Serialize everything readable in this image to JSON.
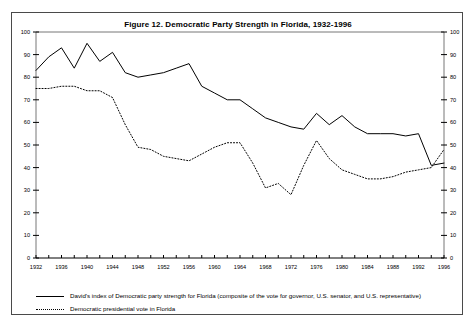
{
  "figure": {
    "title": "Figure 12.  Democratic Party Strength in Florida, 1932-1996",
    "border_color": "#4a4a4a",
    "background": "#ffffff"
  },
  "legend": {
    "position": "below-plot",
    "entries": [
      {
        "marker": "solid-line",
        "label": "David's index of Democratic party strength for Florida (composite of the vote for governor, U.S. senator, and U.S. representative)"
      },
      {
        "marker": "dotted-line",
        "label": "Democratic presidential vote in Florida"
      }
    ]
  },
  "chart_data": {
    "type": "line",
    "title": "Figure 12.  Democratic Party Strength in Florida, 1932-1996",
    "xlabel": "",
    "ylabel": "",
    "xlim": [
      1932,
      1996
    ],
    "ylim": [
      0,
      100
    ],
    "ytick_step": 10,
    "xtick_step": 2,
    "xlabel_step": 4,
    "grid": false,
    "dual_y_axis": true,
    "left_axis_labels": [
      "0",
      "10",
      "20",
      "30",
      "40",
      "50",
      "60",
      "70",
      "80",
      "90",
      "100"
    ],
    "right_axis_labels": [
      "0",
      "10",
      "20",
      "30",
      "40",
      "50",
      "60",
      "70",
      "80",
      "90",
      "100"
    ],
    "xtick_labels": [
      "1932",
      "1936",
      "1940",
      "1944",
      "1948",
      "1952",
      "1956",
      "1960",
      "1964",
      "1968",
      "1972",
      "1976",
      "1980",
      "1984",
      "1988",
      "1992",
      "1996"
    ],
    "x": [
      1932,
      1934,
      1936,
      1938,
      1940,
      1942,
      1944,
      1946,
      1948,
      1950,
      1952,
      1954,
      1956,
      1958,
      1960,
      1962,
      1964,
      1966,
      1968,
      1970,
      1972,
      1974,
      1976,
      1978,
      1980,
      1982,
      1984,
      1986,
      1988,
      1990,
      1992,
      1994,
      1996
    ],
    "series": [
      {
        "name": "David's index of Democratic party strength for Florida (composite of the vote for governor, U.S. senator, and U.S. representative)",
        "style": "solid",
        "color": "#000000",
        "values": [
          83,
          89,
          93,
          84,
          95,
          87,
          91,
          82,
          80,
          81,
          82,
          84,
          86,
          76,
          73,
          70,
          70,
          66,
          62,
          60,
          58,
          57,
          64,
          59,
          63,
          58,
          55,
          55,
          55,
          54,
          55,
          41,
          42
        ]
      },
      {
        "name": "Democratic presidential vote in Florida",
        "style": "dotted",
        "color": "#000000",
        "values": [
          75,
          75,
          76,
          76,
          74,
          74,
          71,
          59,
          49,
          48,
          45,
          44,
          43,
          46,
          49,
          51,
          51,
          42,
          31,
          33,
          28,
          41,
          52,
          44,
          39,
          37,
          35,
          35,
          36,
          38,
          39,
          40,
          48
        ]
      }
    ]
  }
}
